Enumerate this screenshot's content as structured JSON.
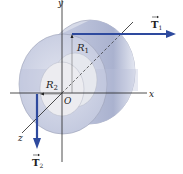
{
  "diagram": {
    "type": "cylinder-torque",
    "axes": {
      "x_label": "x",
      "y_label": "y",
      "z_label": "z",
      "origin_label": "O"
    },
    "radii": {
      "outer": {
        "symbol": "R",
        "subscript": "1"
      },
      "inner": {
        "symbol": "R",
        "subscript": "2"
      }
    },
    "forces": [
      {
        "symbol": "T",
        "subscript": "1",
        "direction": "+x"
      },
      {
        "symbol": "T",
        "subscript": "2",
        "direction": "-y"
      }
    ],
    "colors": {
      "force_arrow": "#2e4a9e",
      "cylinder_face": "#c9cfe3",
      "cylinder_side": "#a9b1cf",
      "inner_cylinder": "#e2e4ea",
      "axis": "#222222"
    }
  }
}
